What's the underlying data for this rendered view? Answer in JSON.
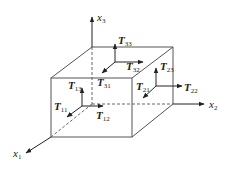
{
  "diagram": {
    "type": "stress-tensor-cube",
    "axes": [
      {
        "id": "x1",
        "base": "x",
        "sub": "1"
      },
      {
        "id": "x2",
        "base": "x",
        "sub": "2"
      },
      {
        "id": "x3",
        "base": "x",
        "sub": "3"
      }
    ],
    "front_face": {
      "components": [
        {
          "id": "T11",
          "base": "T",
          "sub": "11"
        },
        {
          "id": "T12",
          "base": "T",
          "sub": "12"
        },
        {
          "id": "T13",
          "base": "T",
          "sub": "13"
        }
      ]
    },
    "right_face": {
      "components": [
        {
          "id": "T21",
          "base": "T",
          "sub": "21"
        },
        {
          "id": "T22",
          "base": "T",
          "sub": "22"
        },
        {
          "id": "T23",
          "base": "T",
          "sub": "23"
        }
      ]
    },
    "top_face": {
      "components": [
        {
          "id": "T31",
          "base": "T",
          "sub": "31"
        },
        {
          "id": "T32",
          "base": "T",
          "sub": "32"
        },
        {
          "id": "T33",
          "base": "T",
          "sub": "33"
        }
      ]
    },
    "colors": {
      "edge": "#555555",
      "arrow": "#222222",
      "background": "#ffffff"
    }
  }
}
